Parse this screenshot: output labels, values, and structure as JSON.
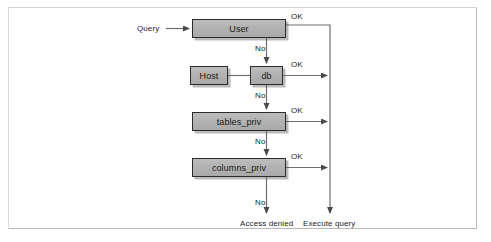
{
  "diagram": {
    "type": "flowchart",
    "nodes": [
      {
        "id": "user",
        "label": "User",
        "shape": "process"
      },
      {
        "id": "host",
        "label": "Host",
        "shape": "process"
      },
      {
        "id": "db",
        "label": "db",
        "shape": "process"
      },
      {
        "id": "tables_priv",
        "label": "tables_priv",
        "shape": "process"
      },
      {
        "id": "columns_priv",
        "label": "columns_priv",
        "shape": "process"
      }
    ],
    "terminals": [
      {
        "id": "query",
        "label": "Query"
      },
      {
        "id": "access_denied",
        "label": "Access denied"
      },
      {
        "id": "execute_query",
        "label": "Execute query"
      }
    ],
    "edge_labels": {
      "ok": "OK",
      "no": "No"
    },
    "edges": [
      {
        "from": "query",
        "to": "user",
        "label": "",
        "arrow": true
      },
      {
        "from": "user",
        "to": "execute_query",
        "label": "OK",
        "arrow": true
      },
      {
        "from": "user",
        "to": "db",
        "label": "No",
        "arrow": true
      },
      {
        "from": "host",
        "to": "db",
        "label": "",
        "arrow": false
      },
      {
        "from": "db",
        "to": "execute_query",
        "label": "OK",
        "arrow": true
      },
      {
        "from": "db",
        "to": "tables_priv",
        "label": "No",
        "arrow": true
      },
      {
        "from": "tables_priv",
        "to": "execute_query",
        "label": "OK",
        "arrow": true
      },
      {
        "from": "tables_priv",
        "to": "columns_priv",
        "label": "No",
        "arrow": true
      },
      {
        "from": "columns_priv",
        "to": "execute_query",
        "label": "OK",
        "arrow": true
      },
      {
        "from": "columns_priv",
        "to": "access_denied",
        "label": "No",
        "arrow": true
      }
    ],
    "colors": {
      "box_fill": "#b4b4b4",
      "box_border": "#2b2b2b",
      "line": "#6b6b6b",
      "text": "#1a1a1a",
      "frame_border": "#b9b9b9",
      "background": "#ffffff"
    }
  }
}
